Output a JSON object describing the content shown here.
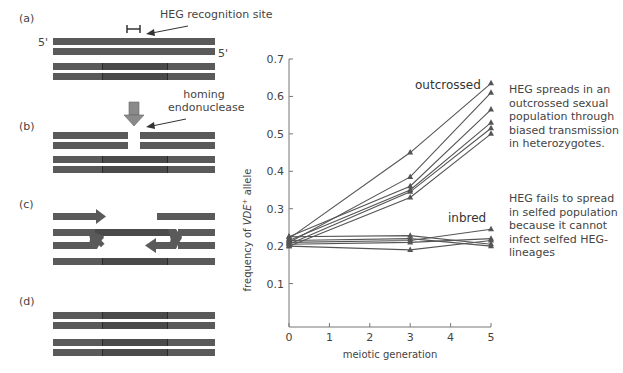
{
  "diagram": {
    "panels": [
      {
        "id": "a",
        "label": "(a)",
        "annotation": "HEG recognition site",
        "strand_label_top": "5'",
        "strand_label_bottom": "5'"
      },
      {
        "id": "b",
        "label": "(b)",
        "annotation_line1": "homing",
        "annotation_line2": "endonuclease"
      },
      {
        "id": "c",
        "label": "(c)"
      },
      {
        "id": "d",
        "label": "(d)"
      }
    ],
    "colors": {
      "strand": "#5a5a5a",
      "strand_dark": "#4a4a4a",
      "arrow": "#8a8a8a"
    }
  },
  "chart_data": {
    "type": "line",
    "title": "",
    "xlabel": "meiotic generation",
    "ylabel_prefix": "frequency of ",
    "ylabel_italic": "VDE",
    "ylabel_sup": "+",
    "ylabel_suffix": " allele",
    "x": [
      0,
      3,
      5
    ],
    "xlim": [
      0,
      5
    ],
    "ylim": [
      0,
      0.7
    ],
    "xticks": [
      "0",
      "1",
      "2",
      "3",
      "4",
      "5"
    ],
    "yticks": [
      "0.1",
      "0.2",
      "0.3",
      "0.4",
      "0.5",
      "0.6",
      "0.7"
    ],
    "grid": false,
    "marker": "triangle",
    "series_groups": [
      {
        "name": "outcrossed",
        "series": [
          {
            "name": "outcrossed-1",
            "values": [
              0.22,
              0.45,
              0.635
            ]
          },
          {
            "name": "outcrossed-2",
            "values": [
              0.21,
              0.385,
              0.61
            ]
          },
          {
            "name": "outcrossed-3",
            "values": [
              0.225,
              0.36,
              0.565
            ]
          },
          {
            "name": "outcrossed-4",
            "values": [
              0.215,
              0.35,
              0.53
            ]
          },
          {
            "name": "outcrossed-5",
            "values": [
              0.205,
              0.345,
              0.515
            ]
          },
          {
            "name": "outcrossed-6",
            "values": [
              0.2,
              0.33,
              0.5
            ]
          }
        ]
      },
      {
        "name": "inbred",
        "series": [
          {
            "name": "inbred-1",
            "values": [
              0.225,
              0.228,
              0.205
            ]
          },
          {
            "name": "inbred-2",
            "values": [
              0.215,
              0.22,
              0.2
            ]
          },
          {
            "name": "inbred-3",
            "values": [
              0.21,
              0.215,
              0.245
            ]
          },
          {
            "name": "inbred-4",
            "values": [
              0.205,
              0.21,
              0.22
            ]
          },
          {
            "name": "inbred-5",
            "values": [
              0.2,
              0.19,
              0.215
            ]
          }
        ]
      }
    ],
    "color": "#555555"
  },
  "notes": {
    "outcrossed": [
      "HEG spreads in an",
      "outcrossed sexual",
      "population through",
      "biased transmission",
      "in heterozygotes."
    ],
    "inbred": [
      "HEG fails to spread",
      "in selfed population",
      "because it cannot",
      "infect selfed HEG-",
      "lineages"
    ]
  }
}
